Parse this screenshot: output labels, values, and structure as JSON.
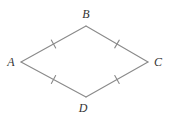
{
  "diagram": {
    "type": "quadrilateral",
    "background": "#ffffff",
    "stroke_color": "#8a8a8a",
    "stroke_width": 1.1,
    "label_color": "#333333",
    "label_font_size": 12,
    "tick_length": 9,
    "vertices": [
      {
        "id": "A",
        "x": 21,
        "y": 62,
        "label": "A",
        "label_x": 11,
        "label_y": 66
      },
      {
        "id": "B",
        "x": 86,
        "y": 26,
        "label": "B",
        "label_x": 86,
        "label_y": 18
      },
      {
        "id": "C",
        "x": 148,
        "y": 62,
        "label": "C",
        "label_x": 158,
        "label_y": 66
      },
      {
        "id": "D",
        "x": 86,
        "y": 97,
        "label": "D",
        "label_x": 83,
        "label_y": 112
      }
    ],
    "edges": [
      {
        "from": "A",
        "to": "B",
        "tick": true
      },
      {
        "from": "B",
        "to": "C",
        "tick": true
      },
      {
        "from": "C",
        "to": "D",
        "tick": true
      },
      {
        "from": "D",
        "to": "A",
        "tick": true
      }
    ]
  }
}
